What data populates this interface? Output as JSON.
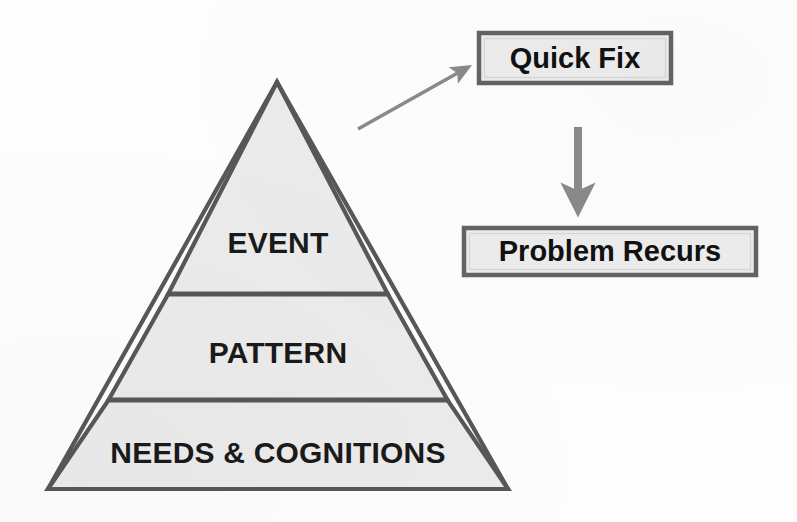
{
  "diagram": {
    "type": "pyramid-with-flow",
    "background_color": "#fdfdfd",
    "pyramid": {
      "name": "levels-pyramid",
      "fill_color": "#ebebeb",
      "stroke_color": "#575757",
      "apex": {
        "x": 277,
        "y": 82
      },
      "base_left": {
        "x": 48,
        "y": 489
      },
      "base_right": {
        "x": 508,
        "y": 489
      },
      "divider_y": [
        294,
        400
      ],
      "tiers": [
        {
          "id": "event",
          "label": "EVENT",
          "order": 1
        },
        {
          "id": "pattern",
          "label": "PATTERN",
          "order": 2
        },
        {
          "id": "needs-cognitions",
          "label": "NEEDS & COGNITIONS",
          "order": 3
        }
      ]
    },
    "boxes": [
      {
        "id": "quick-fix",
        "label": "Quick Fix",
        "x": 477,
        "y": 31,
        "width": 196,
        "height": 54,
        "fill_color": "#ececec",
        "border_color": "#636363"
      },
      {
        "id": "problem-recurs",
        "label": "Problem Recurs",
        "x": 462,
        "y": 226,
        "width": 296,
        "height": 51,
        "fill_color": "#ececec",
        "border_color": "#636363"
      }
    ],
    "arrows": [
      {
        "id": "event-to-quick-fix",
        "from": "pyramid-event-tier",
        "to": "quick-fix",
        "orientation": "diagonal-up-right",
        "color": "#8a8a8a",
        "start": {
          "x": 358,
          "y": 129
        },
        "end": {
          "x": 468,
          "y": 68
        }
      },
      {
        "id": "quick-fix-to-problem-recurs",
        "from": "quick-fix",
        "to": "problem-recurs",
        "orientation": "vertical-down",
        "color": "#8a8a8a",
        "start": {
          "x": 578,
          "y": 127
        },
        "end": {
          "x": 578,
          "y": 212
        }
      }
    ]
  }
}
